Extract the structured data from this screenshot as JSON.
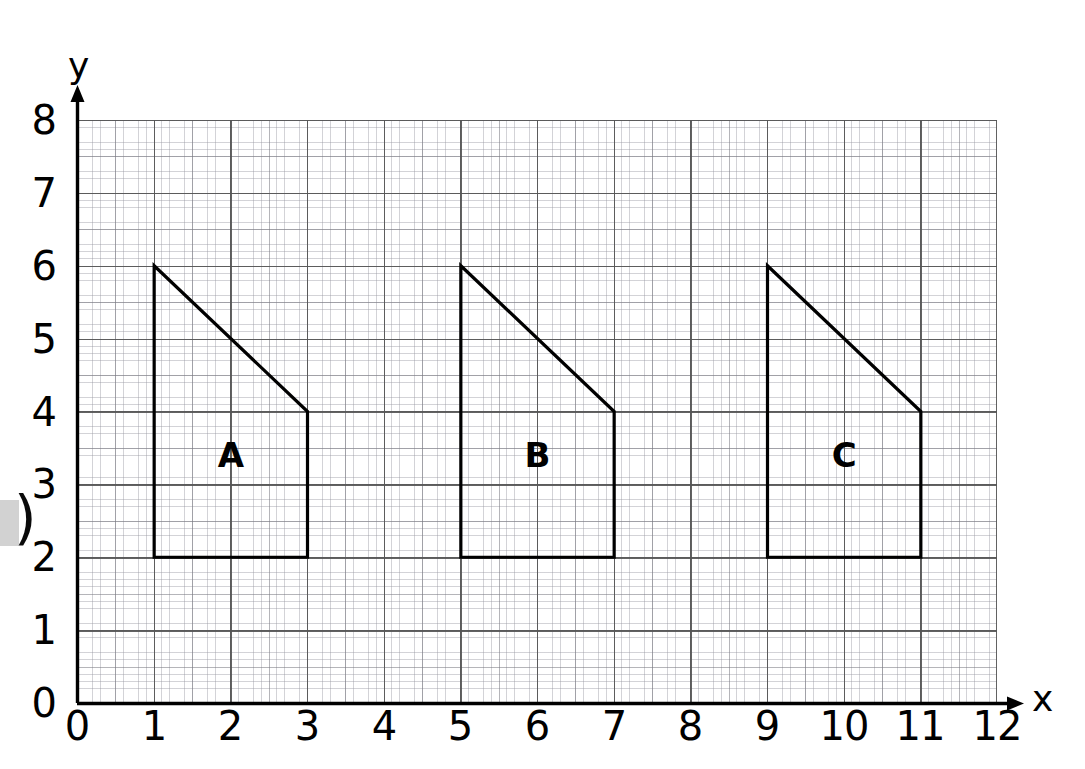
{
  "figure": {
    "kind": "coordinate-grid-graph-paper",
    "background_color": "#ffffff",
    "ink_color": "#000000",
    "grid_line_color": "#555555"
  },
  "axes": {
    "x_name": "x",
    "y_name": "y",
    "x_ticks": [
      "0",
      "1",
      "2",
      "3",
      "4",
      "5",
      "6",
      "7",
      "8",
      "9",
      "10",
      "11",
      "12"
    ],
    "y_ticks": [
      "0",
      "1",
      "2",
      "3",
      "4",
      "5",
      "6",
      "7",
      "8"
    ],
    "x_range": [
      0,
      12
    ],
    "y_range": [
      0,
      8
    ],
    "x_tick_step": 1,
    "y_tick_step": 1,
    "minor_divisions_per_unit": 10,
    "medium_divisions_per_unit": 2,
    "has_x_arrow": true,
    "has_y_arrow": true
  },
  "chart_data": {
    "type": "scatter",
    "title": "",
    "xlabel": "x",
    "ylabel": "y",
    "xlim": [
      0,
      12
    ],
    "ylim": [
      0,
      8
    ],
    "grid": true,
    "legend": "none",
    "shapes": [
      {
        "label": "A",
        "vertices": [
          [
            1,
            6
          ],
          [
            3,
            4
          ],
          [
            3,
            2
          ],
          [
            1,
            2
          ]
        ],
        "label_position": [
          2,
          3.4
        ]
      },
      {
        "label": "B",
        "vertices": [
          [
            5,
            6
          ],
          [
            7,
            4
          ],
          [
            7,
            2
          ],
          [
            5,
            2
          ]
        ],
        "label_position": [
          6,
          3.4
        ]
      },
      {
        "label": "C",
        "vertices": [
          [
            9,
            6
          ],
          [
            11,
            4
          ],
          [
            11,
            2
          ],
          [
            9,
            2
          ]
        ],
        "label_position": [
          10,
          3.4
        ]
      }
    ]
  },
  "artifacts": {
    "edge_paren": ")",
    "edge_block_color": "#d2d2d2"
  }
}
